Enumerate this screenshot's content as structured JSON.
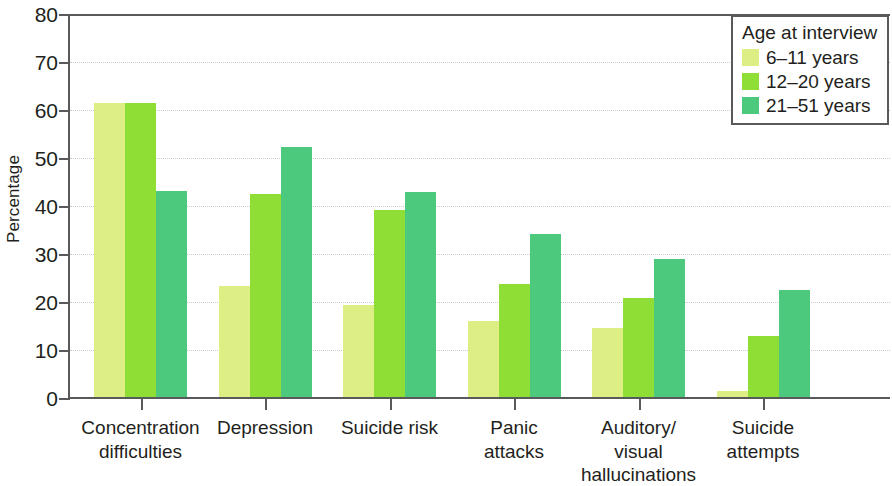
{
  "chart_data": {
    "type": "bar",
    "title": "",
    "subtitle": "",
    "xlabel": "",
    "ylabel": "Percentage",
    "ylim": [
      0,
      80
    ],
    "yticks": [
      0,
      10,
      20,
      30,
      40,
      50,
      60,
      70,
      80
    ],
    "ytick_labels": [
      "0",
      "10",
      "20",
      "30",
      "40",
      "50",
      "60",
      "70",
      "80"
    ],
    "grid": "horizontal-dotted",
    "legend_position": "top-right",
    "legend_title": "Age at interview",
    "categories": [
      "Concentration\ndifficulties",
      "Depression",
      "Suicide risk",
      "Panic\nattacks",
      "Auditory/\nvisual\nhallucinations",
      "Suicide\nattempts"
    ],
    "series": [
      {
        "name": "6–11 years",
        "color": "#ddee85",
        "values": [
          61.2,
          23.2,
          19.2,
          15.8,
          14.3,
          1.3
        ]
      },
      {
        "name": "12–20 years",
        "color": "#8ede35",
        "values": [
          61.2,
          42.2,
          39.0,
          23.5,
          20.7,
          12.7
        ]
      },
      {
        "name": "21–51 years",
        "color": "#4dc97e",
        "values": [
          43.0,
          52.0,
          42.7,
          34.0,
          28.7,
          22.2
        ]
      }
    ],
    "axis_color": "#58595b",
    "grid_color": "#c9cacc",
    "text_color": "#231f20",
    "background": "#ffffff"
  }
}
